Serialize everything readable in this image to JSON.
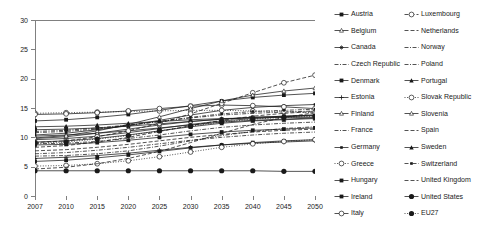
{
  "chart_data": {
    "type": "line",
    "title": "",
    "xlabel": "",
    "ylabel": "",
    "x": [
      2007,
      2010,
      2015,
      2020,
      2025,
      2030,
      2035,
      2040,
      2045,
      2050
    ],
    "x_tick_labels": [
      "2007",
      "2010",
      "2015",
      "2020",
      "2025",
      "2030",
      "2035",
      "2040",
      "2045",
      "2050"
    ],
    "y_tick_labels": [
      "0",
      "5",
      "10",
      "15",
      "20",
      "25",
      "30"
    ],
    "y_ticks": [
      0,
      5,
      10,
      15,
      20,
      25,
      30
    ],
    "ylim": [
      0,
      30
    ],
    "xlim": [
      2007,
      2050
    ],
    "grid": false,
    "legend_position": "right",
    "legend_columns": 2,
    "series": [
      {
        "name": "Austria",
        "marker": "square-filled",
        "dash": "solid",
        "values": [
          12.8,
          13.0,
          13.4,
          13.9,
          14.6,
          15.4,
          16.2,
          16.8,
          17.2,
          17.5
        ]
      },
      {
        "name": "Belgium",
        "marker": "triangle-open",
        "dash": "solid",
        "values": [
          10.2,
          10.4,
          10.7,
          11.1,
          11.6,
          12.1,
          12.6,
          12.9,
          13.1,
          13.3
        ]
      },
      {
        "name": "Canada",
        "marker": "star",
        "dash": "solid",
        "values": [
          9.6,
          9.8,
          10.2,
          10.8,
          11.5,
          12.2,
          12.8,
          13.2,
          13.5,
          13.7
        ]
      },
      {
        "name": "Czech Republic",
        "marker": "none",
        "dash": "dashdot",
        "values": [
          8.9,
          9.0,
          9.3,
          9.8,
          10.4,
          11.1,
          11.7,
          12.1,
          12.4,
          12.6
        ]
      },
      {
        "name": "Denmark",
        "marker": "square-filled",
        "dash": "solid",
        "values": [
          11.3,
          11.4,
          11.6,
          11.9,
          12.3,
          12.7,
          13.1,
          13.4,
          13.6,
          13.8
        ]
      },
      {
        "name": "Estonia",
        "marker": "plus",
        "dash": "solid",
        "values": [
          6.4,
          6.6,
          6.9,
          7.3,
          7.8,
          8.3,
          8.7,
          9.0,
          9.2,
          9.4
        ]
      },
      {
        "name": "Finland",
        "marker": "triangle-small",
        "dash": "solid",
        "values": [
          9.8,
          10.1,
          10.7,
          11.4,
          12.1,
          12.7,
          13.1,
          13.4,
          13.6,
          13.8
        ]
      },
      {
        "name": "France",
        "marker": "none",
        "dash": "dashdot",
        "values": [
          11.0,
          11.2,
          11.6,
          12.1,
          12.7,
          13.3,
          13.8,
          14.1,
          14.3,
          14.5
        ]
      },
      {
        "name": "Germany",
        "marker": "square-small",
        "dash": "solid",
        "values": [
          10.4,
          10.7,
          11.3,
          12.0,
          12.9,
          13.8,
          14.6,
          15.1,
          15.4,
          15.6
        ]
      },
      {
        "name": "Greece",
        "marker": "circle-open",
        "dash": "dotted",
        "values": [
          14.1,
          14.2,
          14.3,
          14.4,
          14.5,
          14.6,
          14.6,
          14.5,
          14.4,
          14.2
        ]
      },
      {
        "name": "Hungary",
        "marker": "square-filled",
        "dash": "solid",
        "values": [
          8.7,
          8.8,
          9.1,
          9.5,
          10.0,
          10.5,
          10.9,
          11.2,
          11.4,
          11.6
        ]
      },
      {
        "name": "Ireland",
        "marker": "square-filled",
        "dash": "solid",
        "values": [
          5.9,
          6.1,
          6.5,
          7.0,
          7.6,
          8.2,
          8.7,
          9.1,
          9.4,
          9.6
        ]
      },
      {
        "name": "Italy",
        "marker": "circle-open",
        "dash": "solid",
        "values": [
          13.9,
          14.0,
          14.2,
          14.5,
          14.9,
          15.3,
          15.5,
          15.4,
          15.2,
          14.9
        ]
      },
      {
        "name": "Luxembourg",
        "marker": "circle-open",
        "dash": "dashed",
        "values": [
          9.1,
          9.4,
          10.1,
          11.1,
          12.4,
          14.0,
          15.8,
          17.6,
          19.3,
          20.6
        ]
      },
      {
        "name": "Netherlands",
        "marker": "none",
        "dash": "dashed",
        "values": [
          8.3,
          8.6,
          9.2,
          10.0,
          11.0,
          12.0,
          12.9,
          13.6,
          14.1,
          14.4
        ]
      },
      {
        "name": "Norway",
        "marker": "none",
        "dash": "dashdot",
        "values": [
          7.2,
          7.4,
          7.8,
          8.3,
          8.9,
          9.5,
          10.0,
          10.4,
          10.7,
          10.9
        ]
      },
      {
        "name": "Poland",
        "marker": "none",
        "dash": "dashdot",
        "values": [
          6.8,
          6.9,
          7.2,
          7.7,
          8.5,
          9.4,
          10.3,
          11.0,
          11.5,
          11.8
        ]
      },
      {
        "name": "Portugal",
        "marker": "triangle-filled",
        "dash": "solid",
        "values": [
          9.2,
          9.4,
          9.8,
          10.4,
          11.1,
          11.8,
          12.4,
          12.8,
          13.0,
          13.2
        ]
      },
      {
        "name": "Slovak Republic",
        "marker": "circle-open",
        "dash": "dotted",
        "values": [
          5.1,
          5.2,
          5.5,
          6.0,
          6.7,
          7.5,
          8.3,
          8.9,
          9.3,
          9.6
        ]
      },
      {
        "name": "Slovenia",
        "marker": "triangle-small",
        "dash": "solid",
        "values": [
          9.9,
          10.3,
          11.1,
          12.2,
          13.5,
          14.9,
          16.2,
          17.2,
          17.9,
          18.4
        ]
      },
      {
        "name": "Spain",
        "marker": "none",
        "dash": "dashed",
        "values": [
          4.6,
          4.9,
          5.5,
          6.4,
          7.6,
          9.1,
          10.7,
          12.2,
          13.4,
          14.2
        ]
      },
      {
        "name": "Sweden",
        "marker": "triangle-filled",
        "dash": "solid",
        "values": [
          11.8,
          11.9,
          12.1,
          12.4,
          12.7,
          13.0,
          13.2,
          13.3,
          13.4,
          13.4
        ]
      },
      {
        "name": "Switzerland",
        "marker": "square-small",
        "dash": "dashdot",
        "values": [
          10.8,
          11.0,
          11.4,
          12.0,
          12.7,
          13.4,
          14.0,
          14.4,
          14.6,
          14.8
        ]
      },
      {
        "name": "United Kingdom",
        "marker": "none",
        "dash": "dashed",
        "values": [
          7.7,
          7.9,
          8.3,
          8.8,
          9.4,
          10.0,
          10.5,
          10.9,
          11.2,
          11.4
        ]
      },
      {
        "name": "United States",
        "marker": "circle-filled",
        "dash": "solid",
        "values": [
          4.3,
          4.3,
          4.3,
          4.3,
          4.3,
          4.3,
          4.3,
          4.3,
          4.2,
          4.2
        ]
      },
      {
        "name": "EU27",
        "marker": "circle-filled",
        "dash": "dotted",
        "values": [
          9.0,
          9.2,
          9.7,
          10.3,
          11.1,
          11.9,
          12.6,
          13.1,
          13.4,
          13.6
        ]
      }
    ]
  },
  "legend": {
    "columns": [
      {
        "items": [
          "Austria",
          "Belgium",
          "Canada",
          "Czech Republic",
          "Denmark",
          "Estonia",
          "Finland",
          "France",
          "Germany",
          "Greece",
          "Hungary",
          "Ireland",
          "Italy"
        ]
      },
      {
        "items": [
          "Luxembourg",
          "Netherlands",
          "Norway",
          "Poland",
          "Portugal",
          "Slovak Republic",
          "Slovenia",
          "Spain",
          "Sweden",
          "Switzerland",
          "United Kingdom",
          "United States",
          "EU27"
        ]
      }
    ]
  },
  "colors": {
    "axis": "#808080",
    "series": "#1a1a1a",
    "background": "#ffffff"
  }
}
